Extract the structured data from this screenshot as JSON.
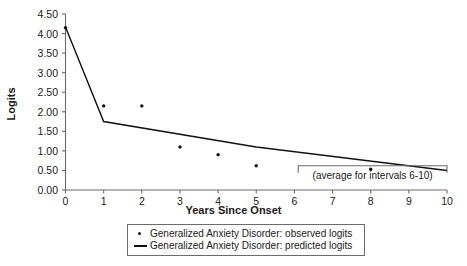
{
  "chart_data": {
    "type": "scatter",
    "title": "",
    "xlabel": "Years Since Onset",
    "ylabel": "Logits",
    "xlim": [
      0,
      10
    ],
    "ylim": [
      0,
      4.5
    ],
    "grid": false,
    "legend_position": "bottom",
    "xticks": [
      "0",
      "1",
      "2",
      "3",
      "4",
      "5",
      "6",
      "7",
      "8",
      "9",
      "10"
    ],
    "xtick_values": [
      0,
      1,
      2,
      3,
      4,
      5,
      6,
      7,
      8,
      9,
      10
    ],
    "yticks": [
      "0.00",
      "0.50",
      "1.00",
      "1.50",
      "2.00",
      "2.50",
      "3.00",
      "3.50",
      "4.00",
      "4.50"
    ],
    "ytick_values": [
      0,
      0.5,
      1.0,
      1.5,
      2.0,
      2.5,
      3.0,
      3.5,
      4.0,
      4.5
    ],
    "series": [
      {
        "name": "Generalized Anxiety Disorder: observed logits",
        "type": "scatter",
        "marker": "dot",
        "color": "#111111",
        "x": [
          0,
          1,
          2,
          3,
          4,
          5,
          8
        ],
        "values": [
          4.15,
          2.15,
          2.15,
          1.1,
          0.9,
          0.62,
          0.53
        ]
      },
      {
        "name": "Generalized Anxiety Disorder: predicted logits",
        "type": "line",
        "color": "#111111",
        "x": [
          0,
          1,
          5,
          10
        ],
        "values": [
          4.17,
          1.75,
          1.1,
          0.5
        ]
      }
    ],
    "annotations": [
      {
        "text": "(average for intervals 6-10)",
        "bracket_x_start": 6.1,
        "bracket_x_end": 10,
        "bracket_y": 0.62,
        "text_y": 0.35
      }
    ]
  },
  "legend": {
    "items": [
      {
        "label": "Generalized Anxiety Disorder: observed logits",
        "key": "dot-marker"
      },
      {
        "label": "Generalized Anxiety Disorder: predicted logits",
        "key": "line-marker"
      }
    ]
  },
  "colors": {
    "axis": "#6b6b6b",
    "data": "#111111",
    "text": "#1a1a1a",
    "background": "#ffffff"
  }
}
